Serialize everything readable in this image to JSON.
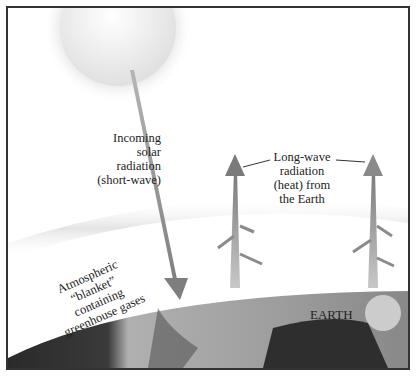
{
  "diagram": {
    "labels": {
      "incoming": [
        "Incoming",
        "solar",
        "radiation",
        "(short-wave)"
      ],
      "longwave": [
        "Long-wave",
        "radiation",
        "(heat) from",
        "the Earth"
      ],
      "atmosphere": [
        "Atmospheric",
        "“blanket”",
        "containing",
        "greenhouse gases"
      ],
      "earth": "EARTH"
    },
    "elements": {
      "sun": "sun",
      "incoming_arrow": "short-wave radiation arrow",
      "outgoing_arrows": 2,
      "atmosphere_band": "atmospheric blanket",
      "earth_surface": "earth"
    },
    "colors": {
      "arrow": "#8a8a8a",
      "border": "#333333",
      "earth_dark": "#2e2e2e",
      "earth_light": "#a8a8a8"
    }
  }
}
